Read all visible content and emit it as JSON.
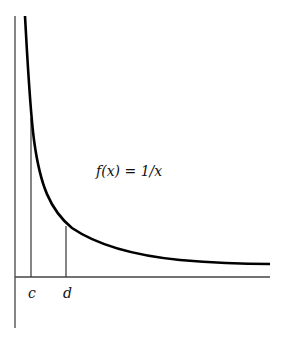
{
  "diagram": {
    "function_label": "f(x) = 1/x",
    "x_markers": [
      {
        "label": "c"
      },
      {
        "label": "d"
      }
    ],
    "colors": {
      "curve": "#000000",
      "axes": "#333333",
      "background": "#ffffff"
    }
  }
}
